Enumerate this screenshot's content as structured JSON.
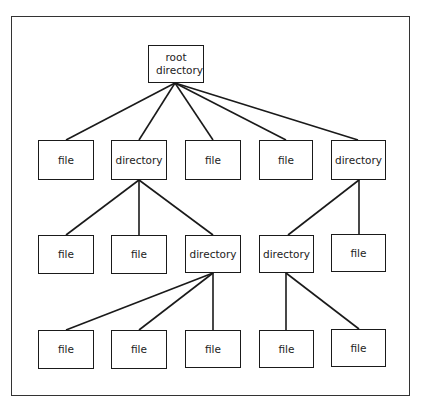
{
  "diagram": {
    "type": "tree",
    "title": "",
    "colors": {
      "line": "#1a1a1a",
      "frame": "#333333",
      "background": "#ffffff"
    },
    "nodes": [
      {
        "id": "root",
        "label": "root directory",
        "x": 148,
        "y": 45,
        "w": 56,
        "h": 38
      },
      {
        "id": "r1a",
        "label": "file",
        "x": 38,
        "y": 140,
        "w": 56,
        "h": 40
      },
      {
        "id": "r1b",
        "label": "directory",
        "x": 111,
        "y": 140,
        "w": 56,
        "h": 40
      },
      {
        "id": "r1c",
        "label": "file",
        "x": 185,
        "y": 140,
        "w": 56,
        "h": 40
      },
      {
        "id": "r1d",
        "label": "file",
        "x": 259,
        "y": 140,
        "w": 54,
        "h": 40
      },
      {
        "id": "r1e",
        "label": "directory",
        "x": 331,
        "y": 140,
        "w": 55,
        "h": 40
      },
      {
        "id": "r2a",
        "label": "file",
        "x": 38,
        "y": 235,
        "w": 56,
        "h": 39
      },
      {
        "id": "r2b",
        "label": "file",
        "x": 111,
        "y": 235,
        "w": 56,
        "h": 39
      },
      {
        "id": "r2c",
        "label": "directory",
        "x": 185,
        "y": 235,
        "w": 56,
        "h": 38
      },
      {
        "id": "r2d",
        "label": "directory",
        "x": 259,
        "y": 235,
        "w": 55,
        "h": 38
      },
      {
        "id": "r2e",
        "label": "file",
        "x": 331,
        "y": 234,
        "w": 55,
        "h": 38
      },
      {
        "id": "r3a",
        "label": "file",
        "x": 38,
        "y": 330,
        "w": 56,
        "h": 39
      },
      {
        "id": "r3b",
        "label": "file",
        "x": 111,
        "y": 330,
        "w": 56,
        "h": 39
      },
      {
        "id": "r3c",
        "label": "file",
        "x": 185,
        "y": 330,
        "w": 56,
        "h": 38
      },
      {
        "id": "r3d",
        "label": "file",
        "x": 259,
        "y": 330,
        "w": 55,
        "h": 38
      },
      {
        "id": "r3e",
        "label": "file",
        "x": 331,
        "y": 329,
        "w": 55,
        "h": 38
      }
    ],
    "edges": [
      {
        "from": "root",
        "to": "r1a",
        "x1": 175,
        "y1": 83,
        "x2": 66,
        "y2": 140
      },
      {
        "from": "root",
        "to": "r1b",
        "x1": 175,
        "y1": 83,
        "x2": 139,
        "y2": 140
      },
      {
        "from": "root",
        "to": "r1c",
        "x1": 175,
        "y1": 83,
        "x2": 213,
        "y2": 140
      },
      {
        "from": "root",
        "to": "r1d",
        "x1": 175,
        "y1": 83,
        "x2": 286,
        "y2": 140
      },
      {
        "from": "root",
        "to": "r1e",
        "x1": 175,
        "y1": 83,
        "x2": 358,
        "y2": 140
      },
      {
        "from": "r1b",
        "to": "r2a",
        "x1": 139,
        "y1": 180,
        "x2": 66,
        "y2": 235
      },
      {
        "from": "r1b",
        "to": "r2b",
        "x1": 139,
        "y1": 180,
        "x2": 139,
        "y2": 235
      },
      {
        "from": "r1b",
        "to": "r2c",
        "x1": 139,
        "y1": 180,
        "x2": 213,
        "y2": 235
      },
      {
        "from": "r1e",
        "to": "r2d",
        "x1": 359,
        "y1": 180,
        "x2": 288,
        "y2": 235
      },
      {
        "from": "r1e",
        "to": "r2e",
        "x1": 359,
        "y1": 180,
        "x2": 359,
        "y2": 234
      },
      {
        "from": "r2c",
        "to": "r3a",
        "x1": 213,
        "y1": 273,
        "x2": 66,
        "y2": 330
      },
      {
        "from": "r2c",
        "to": "r3b",
        "x1": 213,
        "y1": 273,
        "x2": 139,
        "y2": 330
      },
      {
        "from": "r2c",
        "to": "r3c",
        "x1": 213,
        "y1": 273,
        "x2": 213,
        "y2": 330
      },
      {
        "from": "r2d",
        "to": "r3d",
        "x1": 286,
        "y1": 273,
        "x2": 286,
        "y2": 330
      },
      {
        "from": "r2d",
        "to": "r3e",
        "x1": 286,
        "y1": 273,
        "x2": 359,
        "y2": 329
      }
    ]
  }
}
